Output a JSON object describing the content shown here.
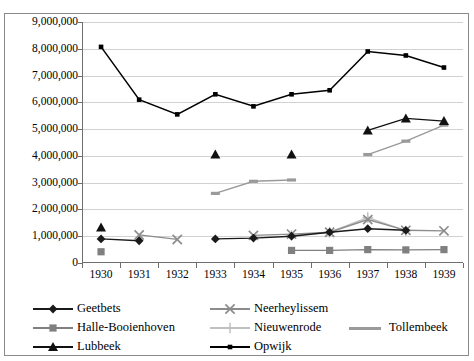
{
  "chart_data": {
    "type": "line",
    "title": "",
    "xlabel": "",
    "ylabel": "",
    "categories": [
      "1930",
      "1931",
      "1932",
      "1933",
      "1934",
      "1935",
      "1936",
      "1937",
      "1938",
      "1939"
    ],
    "yticks": [
      "0",
      "1,000,000",
      "2,000,000",
      "3,000,000",
      "4,000,000",
      "5,000,000",
      "6,000,000",
      "7,000,000",
      "8,000,000",
      "9,000,000"
    ],
    "ylim": [
      0,
      9000000
    ],
    "ytick_step": 1000000,
    "grid": true,
    "legend_position": "bottom",
    "series": [
      {
        "name": "Geetbets",
        "marker": "diamond",
        "color": "#1a1a1a",
        "values": [
          900000,
          830000,
          null,
          900000,
          930000,
          1000000,
          1150000,
          1280000,
          1220000,
          null
        ]
      },
      {
        "name": "Halle-Booienhoven",
        "marker": "square",
        "color": "#808080",
        "values": [
          420000,
          null,
          null,
          null,
          null,
          470000,
          470000,
          500000,
          490000,
          500000
        ]
      },
      {
        "name": "Lubbeek",
        "marker": "triangle",
        "color": "#111111",
        "values": [
          1330000,
          null,
          null,
          4050000,
          null,
          4050000,
          null,
          4950000,
          5400000,
          5300000
        ]
      },
      {
        "name": "Neerheylissem",
        "marker": "cross-x",
        "color": "#8c8c8c",
        "values": [
          null,
          1050000,
          880000,
          null,
          1030000,
          1080000,
          1150000,
          1620000,
          1220000,
          1200000
        ]
      },
      {
        "name": "Nieuwenrode",
        "marker": "plus",
        "color": "#c0c0c0",
        "values": [
          null,
          null,
          null,
          null,
          null,
          1030000,
          1150000,
          1700000,
          1200000,
          null
        ]
      },
      {
        "name": "Tollembeek",
        "marker": "none",
        "color": "#9a9a9a",
        "values": [
          null,
          null,
          null,
          2600000,
          3050000,
          3100000,
          null,
          4050000,
          4550000,
          5150000
        ]
      },
      {
        "name": "Opwijk",
        "marker": "small-square",
        "color": "#000000",
        "values": [
          8070000,
          6100000,
          5550000,
          6300000,
          5850000,
          6300000,
          6450000,
          7900000,
          7750000,
          7300000
        ]
      }
    ]
  },
  "legend": {
    "items": [
      {
        "label": "Geetbets"
      },
      {
        "label": "Halle-Booienhoven"
      },
      {
        "label": "Lubbeek"
      },
      {
        "label": "Neerheylissem"
      },
      {
        "label": "Nieuwenrode"
      },
      {
        "label": "Opwijk"
      },
      {
        "label": "Tollembeek"
      }
    ]
  }
}
